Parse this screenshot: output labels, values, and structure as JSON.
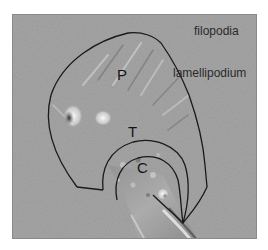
{
  "figure": {
    "background_color": "#9d9d9d",
    "outline_color": "#1a1a1a",
    "labels": {
      "filopodia": "filopodia",
      "lamellipodium": "lamellipodium",
      "peripheral": "P",
      "transition": "T",
      "central": "C"
    }
  }
}
